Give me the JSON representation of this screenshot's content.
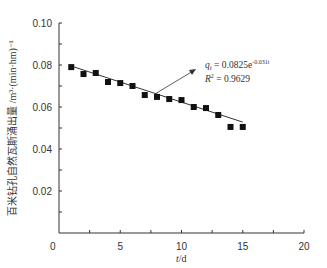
{
  "chart_data": {
    "type": "scatter",
    "title": "",
    "xlabel": "t/d",
    "ylabel": "百米钻孔自然瓦斯涌出量 /m³·(min·hm)⁻¹",
    "xlim": [
      0,
      20
    ],
    "ylim": [
      0,
      0.1
    ],
    "xticks": [
      0,
      5,
      10,
      15,
      20
    ],
    "yticks": [
      0.02,
      0.04,
      0.06,
      0.08,
      0.1
    ],
    "xtick_labels": [
      "0",
      "5",
      "10",
      "15",
      "20"
    ],
    "ytick_labels": [
      "0.02",
      "0.04",
      "0.06",
      "0.08",
      "0.10"
    ],
    "grid": false,
    "legend": null,
    "series": [
      {
        "name": "measured",
        "marker": "square",
        "color": "#111111",
        "x": [
          1,
          2,
          3,
          4,
          5,
          6,
          7,
          8,
          9,
          10,
          11,
          12,
          13,
          14,
          15
        ],
        "values": [
          0.079,
          0.0757,
          0.0762,
          0.0719,
          0.0714,
          0.07,
          0.0657,
          0.0648,
          0.0638,
          0.0633,
          0.06,
          0.0595,
          0.0562,
          0.0505,
          0.0505
        ]
      },
      {
        "name": "fit",
        "type": "line",
        "color": "#333333",
        "x": [
          1,
          15
        ],
        "values": [
          0.0795,
          0.0528
        ]
      }
    ],
    "annotations": [
      {
        "text_main": "q",
        "text_sub": "t",
        "text_rest": " = 0.0825e",
        "text_sup": "-0.031t"
      },
      {
        "text_main": "R",
        "text_sup": "2",
        "text_rest": " = 0.9629"
      }
    ]
  },
  "labels": {
    "origin": "0",
    "x_axis_title_italic": "t",
    "x_axis_title_rest": "/d",
    "y_axis_title": "百米钻孔自然瓦斯涌出量 /m³·(min·hm)⁻¹",
    "eq_q": "q",
    "eq_sub": "t",
    "eq_rest": " = 0.0825e",
    "eq_sup": "-0.031t",
    "r_main": "R",
    "r_sup": "2",
    "r_rest": " = 0.9629"
  }
}
